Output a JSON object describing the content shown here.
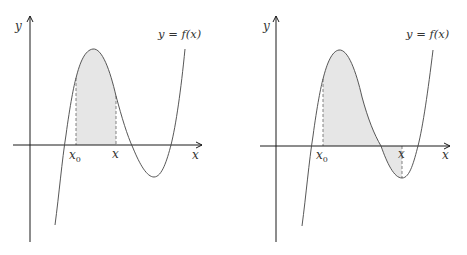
{
  "figures": [
    {
      "id": "left",
      "y_label": "y",
      "x_label": "x",
      "curve_label": "y = f(x)",
      "lower_bound_label": "x",
      "lower_bound_sub": "0",
      "upper_bound_label": "x",
      "description": "Area under f from x0 to x, both on the rising/falling hump above the x-axis"
    },
    {
      "id": "right",
      "y_label": "y",
      "x_label": "x",
      "curve_label": "y = f(x)",
      "lower_bound_label": "x",
      "lower_bound_sub": "0",
      "upper_bound_label": "x",
      "description": "Signed area from x0 to x, where x lies at the trough below the x-axis"
    }
  ],
  "colors": {
    "axis": "#1a1a1a",
    "curve": "#444444",
    "fill": "#e6e6e6",
    "dashed": "#666666"
  }
}
